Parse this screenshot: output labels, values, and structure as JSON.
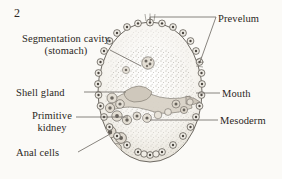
{
  "figure": {
    "number": "2",
    "background_color": "#fbfaf7",
    "ink_color": "#2b2723",
    "line_color": "#6b6660"
  },
  "labels": {
    "segmentation_cavity": {
      "line1": "Segmentation cavity",
      "line2": "(stomach)",
      "side": "left"
    },
    "shell_gland": {
      "text": "Shell gland",
      "side": "left"
    },
    "primitive_kidney": {
      "line1": "Primitive",
      "line2": "kidney",
      "side": "left"
    },
    "anal_cells": {
      "text": "Anal cells",
      "side": "left"
    },
    "prevelum": {
      "text": "Prevelum",
      "side": "right"
    },
    "mouth": {
      "text": "Mouth",
      "side": "right"
    },
    "mesoderm": {
      "text": "Mesoderm",
      "side": "right"
    }
  }
}
